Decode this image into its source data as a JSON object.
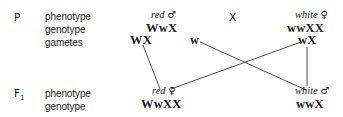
{
  "generations": {
    "parental": {
      "label": "P",
      "row_labels": [
        "phenotype",
        "genotype",
        "gametes"
      ],
      "male": {
        "phenotype": "red",
        "sex_symbol": "♂",
        "genotype": "WwX",
        "gametes": [
          "WX",
          "w"
        ]
      },
      "cross_symbol": "X",
      "female": {
        "phenotype": "white",
        "sex_symbol": "♀",
        "genotype": "wwXX",
        "gametes": [
          "wX"
        ]
      }
    },
    "f1": {
      "label": "F",
      "label_subscript": "1",
      "row_labels": [
        "phenotype",
        "genotype"
      ],
      "female": {
        "phenotype": "red",
        "sex_symbol": "♀",
        "genotype": "WwXX"
      },
      "male": {
        "phenotype": "white",
        "sex_symbol": "♂",
        "genotype": "wwX"
      }
    }
  },
  "connections": [
    {
      "from": "WX",
      "to": "red ♀ WwXX"
    },
    {
      "from": "w",
      "to": "white ♂ wwX"
    },
    {
      "from": "wX",
      "to": "red ♀ WwXX"
    },
    {
      "from": "wX",
      "to": "white ♂ wwX"
    }
  ],
  "line_color": "#3a3a3a"
}
